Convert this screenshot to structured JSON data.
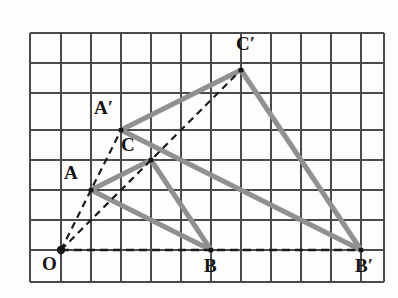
{
  "figure": {
    "grid": {
      "spacing_px": 30,
      "origin_px": [
        61,
        250
      ],
      "x_lines_px": [
        30,
        61,
        91,
        121,
        151,
        181,
        211,
        241,
        271,
        301,
        331,
        361,
        384
      ],
      "y_lines_px": [
        33,
        63,
        93,
        130,
        160,
        190,
        220,
        250,
        282
      ],
      "line_color": "#4a4a4a",
      "background": "#fdfdfc"
    },
    "colors": {
      "triangle_edge": "#909090",
      "ray_dashed": "#1c1c1c",
      "vertex_dot": "#141414",
      "label_text": "#121212"
    },
    "points": [
      {
        "name": "O",
        "label": "O",
        "px": [
          61,
          250
        ],
        "grid": [
          0,
          0
        ],
        "label_px": [
          42,
          254
        ],
        "role": "center-of-dilation"
      },
      {
        "name": "A",
        "label": "A",
        "px": [
          91,
          190
        ],
        "grid": [
          1,
          2
        ],
        "label_px": [
          64,
          163
        ],
        "role": "preimage-vertex"
      },
      {
        "name": "B",
        "label": "B",
        "px": [
          211,
          250
        ],
        "grid": [
          5,
          0
        ],
        "label_px": [
          204,
          256
        ],
        "role": "preimage-vertex"
      },
      {
        "name": "C",
        "label": "C",
        "px": [
          151,
          160
        ],
        "grid": [
          3,
          3
        ],
        "label_px": [
          121,
          135
        ],
        "role": "preimage-vertex"
      },
      {
        "name": "A'",
        "label": "A′",
        "px": [
          121,
          130
        ],
        "grid": [
          2,
          4
        ],
        "label_px": [
          94,
          98
        ],
        "role": "image-vertex"
      },
      {
        "name": "B'",
        "label": "B′",
        "px": [
          361,
          250
        ],
        "grid": [
          10,
          0
        ],
        "label_px": [
          355,
          256
        ],
        "role": "image-vertex"
      },
      {
        "name": "C'",
        "label": "C′",
        "px": [
          241,
          70
        ],
        "grid": [
          6,
          6
        ],
        "label_px": [
          236,
          34
        ],
        "role": "image-vertex"
      }
    ],
    "triangles": [
      {
        "name": "preimage-triangle-ABC",
        "vertices": [
          "A",
          "B",
          "C"
        ],
        "style": "solid-gray-thick"
      },
      {
        "name": "image-triangle-A-prime-B-prime-C-prime",
        "vertices": [
          "A'",
          "B'",
          "C'"
        ],
        "style": "solid-gray-thick"
      }
    ],
    "rays": [
      {
        "name": "ray-O-to-A-prime",
        "from": "O",
        "through": "A",
        "to": "A'",
        "style": "dashed"
      },
      {
        "name": "ray-O-to-B-prime",
        "from": "O",
        "through": "B",
        "to": "B'",
        "style": "dashed"
      },
      {
        "name": "ray-O-to-C-prime",
        "from": "O",
        "through": "C",
        "to": "C'",
        "style": "dashed"
      }
    ],
    "scale_factor": 2
  }
}
